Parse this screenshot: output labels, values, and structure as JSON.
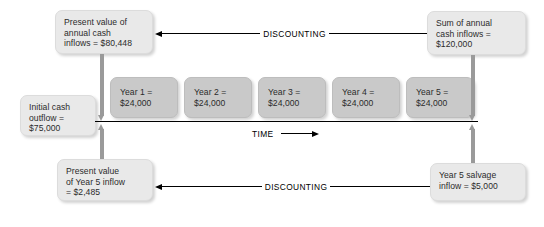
{
  "diagram": {
    "colors": {
      "background": "#ffffff",
      "corner_box_fill": "#e9e9e9",
      "year_box_fill": "#c9c9c9",
      "arrow_gray": "#9a9a9a",
      "line_black": "#000000",
      "text": "#2b2b2b"
    },
    "boxes": {
      "pv_annual": {
        "line1": "Present value of",
        "line2": "annual cash",
        "line3": "inflows = $80,448"
      },
      "sum_annual": {
        "line1": "Sum of annual",
        "line2": "cash inflows =",
        "line3": "$120,000"
      },
      "initial_outflow": {
        "line1": "Initial cash",
        "line2": "outflow =",
        "line3": "$75,000"
      },
      "pv_year5": {
        "line1": "Present value",
        "line2": "of Year 5 inflow",
        "line3": "= $2,485"
      },
      "salvage": {
        "line1": "Year 5 salvage",
        "line2": "inflow = $5,000"
      }
    },
    "years": [
      {
        "label": "Year 1 =",
        "amount": "$24,000"
      },
      {
        "label": "Year 2 =",
        "amount": "$24,000"
      },
      {
        "label": "Year 3 =",
        "amount": "$24,000"
      },
      {
        "label": "Year 4 =",
        "amount": "$24,000"
      },
      {
        "label": "Year 5 =",
        "amount": "$24,000"
      }
    ],
    "connectors": {
      "discounting_top": "DISCOUNTING",
      "discounting_bottom": "DISCOUNTING",
      "time_label": "TIME"
    }
  }
}
